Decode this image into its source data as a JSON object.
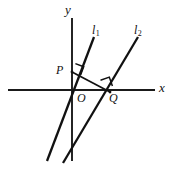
{
  "figure": {
    "kind": "coordinate-geometry-diagram",
    "background_color": "#ffffff",
    "stroke_color": "#111111",
    "width": 172,
    "height": 169,
    "axes": {
      "x_axis": {
        "label": "x",
        "orientation": "horizontal",
        "y": 90,
        "x_start": 8,
        "x_end": 155,
        "label_x": 163,
        "label_y": 88
      },
      "y_axis": {
        "label": "y",
        "orientation": "vertical",
        "x": 72,
        "y_start": 18,
        "y_end": 161,
        "label_x": 70,
        "label_y": 9
      },
      "origin": {
        "label": "O",
        "x": 72,
        "y": 90,
        "label_x": 79,
        "label_y": 98
      }
    },
    "lines": [
      {
        "name": "l-one",
        "label": "l",
        "subscript": "1",
        "x1": 47,
        "y1": 161,
        "x2": 94,
        "y2": 37,
        "label_x": 95,
        "label_y": 31
      },
      {
        "name": "l-two",
        "label": "l",
        "subscript": "2",
        "x1": 63,
        "y1": 163,
        "x2": 138,
        "y2": 37,
        "label_x": 138,
        "label_y": 31
      }
    ],
    "points": [
      {
        "name": "point-p",
        "label": "P",
        "x": 72,
        "y": 72,
        "on_line": "l-one",
        "label_x": 59,
        "label_y": 71
      },
      {
        "name": "point-q",
        "label": "Q",
        "x": 110,
        "y": 92,
        "on_line": "l-two",
        "label_x": 112,
        "label_y": 100
      }
    ],
    "segment": {
      "name": "segment-pq",
      "from": "P",
      "to": "Q",
      "x1": 72,
      "y1": 72,
      "x2": 110,
      "y2": 92
    },
    "right_angles": [
      {
        "name": "right-angle-at-p",
        "at_point": "P",
        "between": [
          "l-one",
          "segment-pq"
        ],
        "size": 9
      },
      {
        "name": "right-angle-at-q",
        "at_point": "Q",
        "between": [
          "segment-pq",
          "l-two"
        ],
        "size": 9
      }
    ]
  }
}
